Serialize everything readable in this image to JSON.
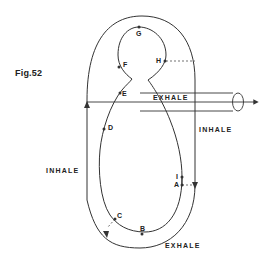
{
  "figure": {
    "label": "Fig.52",
    "colors": {
      "line": "#333333",
      "background": "#ffffff"
    }
  },
  "flows": {
    "exhale_top": "EXHALE",
    "inhale_right": "INHALE",
    "inhale_left": "INHALE",
    "exhale_bottom": "EXHALE"
  },
  "points": {
    "A": "A",
    "B": "B",
    "C": "C",
    "D": "D",
    "E": "E",
    "F": "F",
    "G": "G",
    "H": "H",
    "I": "I"
  }
}
